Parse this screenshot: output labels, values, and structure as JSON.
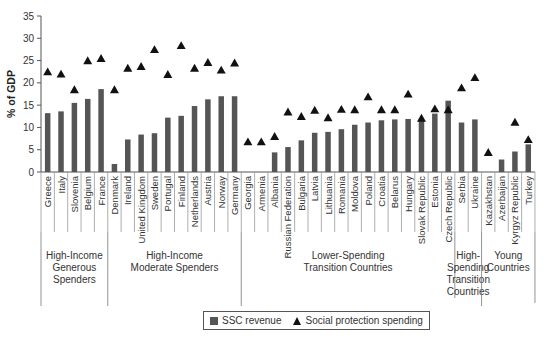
{
  "chart_data": {
    "type": "bar",
    "title": "",
    "xlabel": "",
    "ylabel": "% of GDP",
    "ylim": [
      0,
      35
    ],
    "yticks": [
      0,
      5,
      10,
      15,
      20,
      25,
      30,
      35
    ],
    "grid": false,
    "legend_position": "bottom",
    "categories": [
      "Greece",
      "Italy",
      "Slovenia",
      "Belgium",
      "France",
      "Denmark",
      "Ireland",
      "United Kingdom",
      "Sweden",
      "Portugal",
      "Finland",
      "Netherlands",
      "Austria",
      "Norway",
      "Germany",
      "Georgia",
      "Armenia",
      "Albania",
      "Russian Federation",
      "Bulgaria",
      "Latvia",
      "Lithuania",
      "Romania",
      "Moldova",
      "Poland",
      "Croatia",
      "Belarus",
      "Hungary",
      "Slovak Republic",
      "Estonia",
      "Czech Republic",
      "Serbia",
      "Ukraine",
      "Kazakhstan",
      "Azerbaijan",
      "Kyrgyz Republic",
      "Turkey"
    ],
    "series": [
      {
        "name": "SSC revenue",
        "type": "bar",
        "color": "#555555",
        "values": [
          13.2,
          13.6,
          15.5,
          16.4,
          18.6,
          1.8,
          7.3,
          8.4,
          8.7,
          12.2,
          12.6,
          14.8,
          16.3,
          17.0,
          17.0,
          0,
          0,
          4.4,
          5.6,
          7.1,
          8.8,
          9.0,
          9.6,
          10.6,
          11.1,
          11.6,
          11.8,
          11.9,
          11.6,
          13.1,
          16.0,
          11.1,
          11.8,
          0,
          2.8,
          4.6,
          6.2
        ]
      },
      {
        "name": "Social protection spending",
        "type": "marker-triangle",
        "color": "#111111",
        "values": [
          22.5,
          22.0,
          18.5,
          25.0,
          25.5,
          18.5,
          23.3,
          23.7,
          27.5,
          21.9,
          28.4,
          23.3,
          24.6,
          22.9,
          24.5,
          6.8,
          6.8,
          8.0,
          13.5,
          12.5,
          13.9,
          12.2,
          14.1,
          14.0,
          16.9,
          14.0,
          14.0,
          17.5,
          12.1,
          14.2,
          14.0,
          18.9,
          21.2,
          4.4,
          0,
          11.2,
          7.3
        ]
      }
    ],
    "groups": [
      {
        "label_lines": [
          "High-Income",
          "Generous",
          "Spenders"
        ],
        "start": 0,
        "end": 4
      },
      {
        "label_lines": [
          "High-Income",
          "Moderate Spenders"
        ],
        "start": 5,
        "end": 14
      },
      {
        "label_lines": [
          "Lower-Spending",
          "Transition Countries"
        ],
        "start": 15,
        "end": 30
      },
      {
        "label_lines": [
          "High-",
          "Spending",
          "Transition",
          "Countries"
        ],
        "start": 31,
        "end": 32
      },
      {
        "label_lines": [
          "Young",
          "Countries"
        ],
        "start": 33,
        "end": 36
      }
    ]
  },
  "legend": {
    "bar_label": "SSC revenue",
    "marker_label": "Social protection spending"
  }
}
